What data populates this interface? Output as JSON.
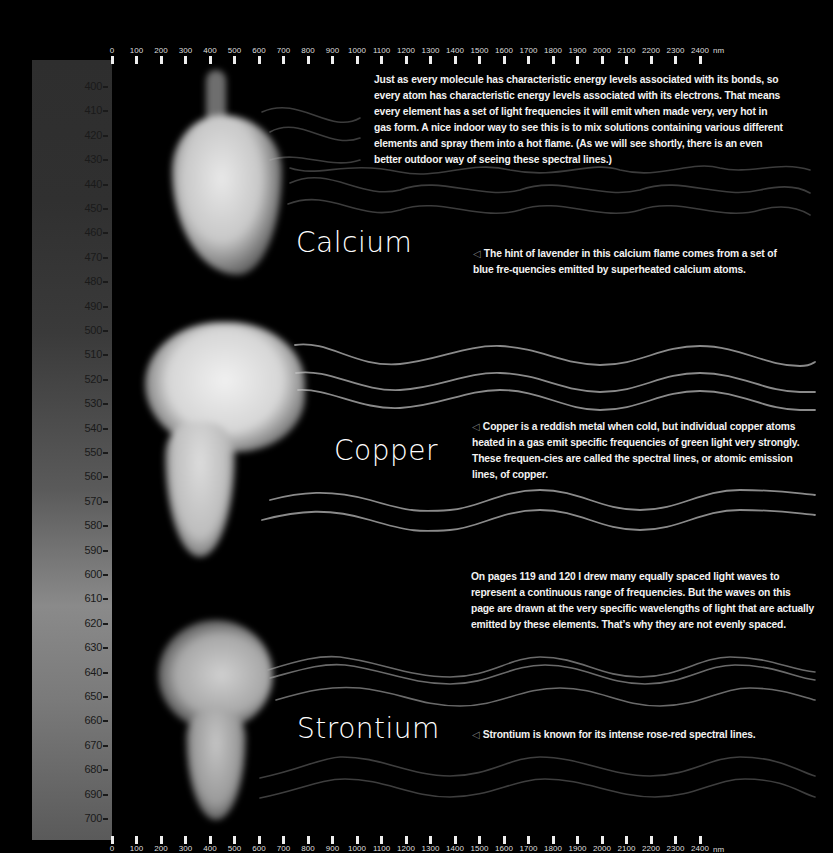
{
  "ruler": {
    "ticks": [
      "0",
      "100",
      "200",
      "300",
      "400",
      "500",
      "600",
      "700",
      "800",
      "900",
      "1000",
      "1100",
      "1200",
      "1300",
      "1400",
      "1500",
      "1600",
      "1700",
      "1800",
      "1900",
      "2000",
      "2100",
      "2200",
      "2300",
      "2400"
    ],
    "unit": "nm"
  },
  "spectrum": {
    "labels": [
      "400",
      "410",
      "420",
      "430",
      "440",
      "450",
      "460",
      "470",
      "480",
      "490",
      "500",
      "510",
      "520",
      "530",
      "540",
      "550",
      "560",
      "570",
      "580",
      "590",
      "600",
      "610",
      "620",
      "630",
      "640",
      "650",
      "660",
      "670",
      "680",
      "690",
      "700"
    ]
  },
  "elements": {
    "calcium": {
      "name": "Calcium",
      "caption_arrow": "◁",
      "caption": "The hint of lavender in this calcium flame comes from a set of blue fre-quencies emitted by superheated calcium atoms."
    },
    "copper": {
      "name": "Copper",
      "caption_arrow": "◁",
      "caption": "Copper is a reddish metal when cold, but individual copper atoms heated in a gas emit specific frequencies of green light very strongly. These frequen-cies are called the spectral lines, or atomic emission lines, of copper."
    },
    "strontium": {
      "name": "Strontium",
      "caption_arrow": "◁",
      "caption": "Strontium is known for its intense rose-red spectral lines."
    }
  },
  "paragraphs": {
    "intro": "Just as every molecule has characteristic energy levels associated with its bonds, so every atom has characteristic energy levels associated with its electrons. That means every element has a set of light frequencies it will emit when made very, very hot in gas form. A nice indoor way to see this is to mix solutions containing various different elements and spray them into a hot flame. (As we will see shortly, there is an even better outdoor way of seeing these spectral lines.)",
    "note": "On pages 119 and 120 I drew many equally spaced light waves to represent a continuous range of frequencies. But the waves on this page are drawn at the very specific wavelengths of light that are actually emitted by these elements. That’s why they are not evenly spaced."
  }
}
